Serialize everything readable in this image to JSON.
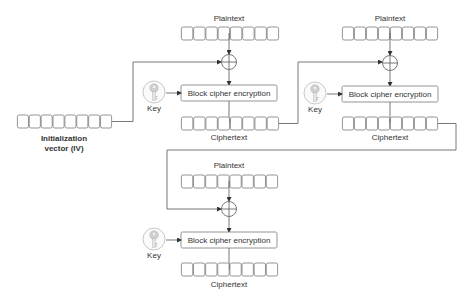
{
  "diagram": {
    "iv": {
      "label_line1": "Initialization",
      "label_line2": "vector (IV)",
      "cells": 8
    },
    "stages": [
      {
        "plaintext_label": "Plaintext",
        "cipher_label": "Block cipher encryption",
        "key_label": "Key",
        "ciphertext_label": "Ciphertext",
        "cells": 8
      },
      {
        "plaintext_label": "Plaintext",
        "cipher_label": "Block cipher encryption",
        "key_label": "Key",
        "ciphertext_label": "Ciphertext",
        "cells": 8
      },
      {
        "plaintext_label": "Plaintext",
        "cipher_label": "Block cipher encryption",
        "key_label": "Key",
        "ciphertext_label": "Ciphertext",
        "cells": 8
      }
    ],
    "icons": {
      "key": "key-icon",
      "xor": "xor-icon"
    },
    "colors": {
      "stroke": "#7a7a7a",
      "wire": "#555555",
      "text": "#333333",
      "key_fill": "#e6e6e6"
    }
  }
}
